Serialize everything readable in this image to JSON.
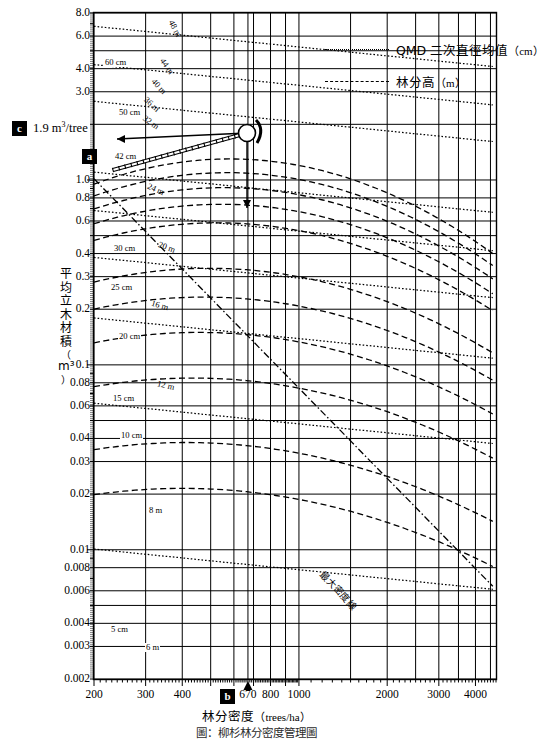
{
  "chart_data": {
    "type": "line",
    "title": "林分密度管理圖",
    "xlabel": "林分密度（trees/ha）",
    "ylabel": "平均立木材積（m³）",
    "x_scale": "log",
    "y_scale": "log",
    "xlim": [
      200,
      4700
    ],
    "ylim": [
      0.002,
      8.0
    ],
    "grid": true,
    "legend_position": "top-right",
    "xticks": [
      "200",
      "300",
      "400",
      "670",
      "800",
      "1000",
      "2000",
      "3000",
      "4000"
    ],
    "xtick_values": [
      200,
      300,
      400,
      670,
      800,
      1000,
      2000,
      3000,
      4000
    ],
    "yticks": [
      "8.0",
      "6.0",
      "4.0",
      "3.0",
      "1.9",
      "1.0",
      "0.8",
      "0.6",
      "0.4",
      "0.3",
      "0.2",
      "0.1",
      "0.08",
      "0.06",
      "0.04",
      "0.03",
      "0.02",
      "0.01",
      "0.008",
      "0.006",
      "0.004",
      "0.003",
      "0.002"
    ],
    "ytick_values": [
      8.0,
      6.0,
      4.0,
      3.0,
      1.9,
      1.0,
      0.8,
      0.6,
      0.4,
      0.3,
      0.2,
      0.1,
      0.08,
      0.06,
      0.04,
      0.03,
      0.02,
      0.01,
      0.008,
      0.006,
      0.004,
      0.003,
      0.002
    ],
    "series": [
      {
        "name": "QMD 二次直徑均值（cm）",
        "style": "dotted",
        "levels_cm": [
          60,
          50,
          42,
          30,
          25,
          20,
          15,
          10,
          5
        ]
      },
      {
        "name": "林分高（m）",
        "style": "dashed",
        "levels_m": [
          48,
          44,
          40,
          36,
          32,
          24,
          20,
          16,
          12,
          8,
          6
        ]
      }
    ],
    "annotations": [
      {
        "label": "a",
        "type": "axis-marker",
        "axis": "y",
        "meaning": "平均立木材積讀值點"
      },
      {
        "label": "b",
        "type": "axis-marker",
        "axis": "x",
        "value": 670,
        "meaning": "林分密度 670 trees/ha"
      },
      {
        "label": "c",
        "type": "value-marker",
        "value": "1.9 m³/tree",
        "meaning": "平均單株材積"
      }
    ],
    "special_line": {
      "name": "最大密度線",
      "style": "dash-dot"
    }
  },
  "axis": {
    "y_title_chars": [
      "平",
      "均",
      "立",
      "木",
      "材",
      "積",
      "（",
      "m³",
      "）"
    ],
    "y_ticks": [
      {
        "label": "8.0",
        "value": 8.0
      },
      {
        "label": "6.0",
        "value": 6.0
      },
      {
        "label": "4.0",
        "value": 4.0
      },
      {
        "label": "3.0",
        "value": 3.0
      },
      {
        "label": "1.0",
        "value": 1.0
      },
      {
        "label": "0.8",
        "value": 0.8
      },
      {
        "label": "0.6",
        "value": 0.6
      },
      {
        "label": "0.4",
        "value": 0.4
      },
      {
        "label": "0.3",
        "value": 0.3
      },
      {
        "label": "0.2",
        "value": 0.2
      },
      {
        "label": "0.1",
        "value": 0.1
      },
      {
        "label": "0.08",
        "value": 0.08
      },
      {
        "label": "0.06",
        "value": 0.06
      },
      {
        "label": "0.04",
        "value": 0.04
      },
      {
        "label": "0.03",
        "value": 0.03
      },
      {
        "label": "0.02",
        "value": 0.02
      },
      {
        "label": "0.01",
        "value": 0.01
      },
      {
        "label": "0.008",
        "value": 0.008
      },
      {
        "label": "0.006",
        "value": 0.006
      },
      {
        "label": "0.004",
        "value": 0.004
      },
      {
        "label": "0.003",
        "value": 0.003
      },
      {
        "label": "0.002",
        "value": 0.002
      }
    ],
    "x_ticks": [
      {
        "label": "200",
        "value": 200
      },
      {
        "label": "300",
        "value": 300
      },
      {
        "label": "400",
        "value": 400
      },
      {
        "label": "670",
        "value": 670
      },
      {
        "label": "800",
        "value": 800
      },
      {
        "label": "1000",
        "value": 1000
      },
      {
        "label": "2000",
        "value": 2000
      },
      {
        "label": "3000",
        "value": 3000
      },
      {
        "label": "4000",
        "value": 4000
      }
    ],
    "x_title_main": "林分密度",
    "x_title_unit": "（trees/ha）"
  },
  "legend": {
    "items": [
      {
        "label": "QMD 二次直徑均值",
        "unit": "（cm）",
        "style": "dotted"
      },
      {
        "label": "林分高",
        "unit": "（m）",
        "style": "dashed"
      }
    ]
  },
  "markers": {
    "a": "a",
    "b": "b",
    "c": "c",
    "c_value": "1.9 m",
    "c_sup": "3",
    "c_tail": "/tree"
  },
  "curve_labels": {
    "qmd": [
      "60 cm",
      "50 cm",
      "42 cm",
      "30 cm",
      "25 cm",
      "20 cm",
      "15 cm",
      "10 cm",
      "5 cm"
    ],
    "height": [
      "48 m",
      "44 m",
      "40 m",
      "36 m",
      "32 m",
      "24 m",
      "20 m",
      "16 m",
      "12 m",
      "8 m",
      "6 m"
    ],
    "max_density": "最大密度線"
  },
  "caption": "圖：柳杉林分密度管理圖",
  "colors": {
    "ink": "#000000",
    "paper": "#ffffff",
    "marker_bg": "#000000",
    "marker_fg": "#ffffff"
  }
}
